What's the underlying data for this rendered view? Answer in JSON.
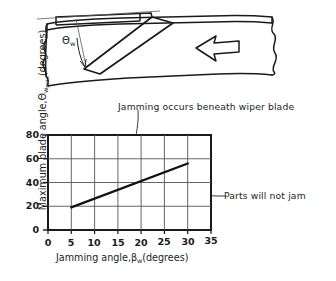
{
  "figure": {
    "schematic": {
      "name": "wiper-blade-schematic",
      "angle_label": "Θ",
      "angle_subscript": "w",
      "flow_arrow_direction": "left",
      "blade_description": "diagonal wiper blade across conveyor track",
      "track_description": "conveyor track with torn break-edges"
    },
    "annotations": [
      {
        "id": "jamming-region",
        "text": "Jamming occurs beneath wiper blade"
      },
      {
        "id": "no-jam-region",
        "text": "Parts will not jam"
      }
    ]
  },
  "chart_data": {
    "type": "line",
    "title": "",
    "xlabel_prefix": "Jamming angle,",
    "xlabel_symbol": "β",
    "xlabel_subscript": "w",
    "xlabel_suffix": "(degrees)",
    "ylabel_prefix": "Maximum blade angle,",
    "ylabel_symbol": "Θ",
    "ylabel_subscript": "w",
    "ylabel_subsubscript": "max",
    "ylabel_suffix": "(degrees)",
    "xticks": [
      0,
      5,
      10,
      15,
      20,
      25,
      30,
      35
    ],
    "yticks": [
      0,
      20,
      40,
      60,
      80
    ],
    "xlim": [
      0,
      35
    ],
    "ylim": [
      0,
      80
    ],
    "grid": true,
    "legend": "none",
    "series": [
      {
        "name": "Maximum blade angle boundary",
        "x": [
          5,
          30
        ],
        "y": [
          19,
          56
        ]
      }
    ],
    "regions": [
      {
        "name": "jamming",
        "label": "Jamming occurs beneath wiper blade",
        "position": "above-line"
      },
      {
        "name": "no-jam",
        "label": "Parts will not jam",
        "position": "below-line"
      }
    ]
  },
  "colors": {
    "ink": "#1a1a1a",
    "grid": "#555555",
    "background": "#ffffff"
  }
}
